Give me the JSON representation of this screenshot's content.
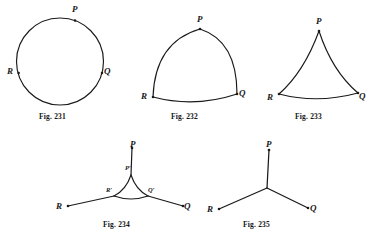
{
  "page": {
    "background_color": "#ffffff",
    "ink_color": "#1a1a1a",
    "width": 375,
    "height": 238
  },
  "figures": [
    {
      "id": "fig-231",
      "caption": "Fig. 231",
      "shape": "circle",
      "description": "A plain circle with three marked points P, R and Q on its circumference.",
      "vertices": [
        {
          "label": "P",
          "position": "top"
        },
        {
          "label": "R",
          "position": "left"
        },
        {
          "label": "Q",
          "position": "right"
        }
      ]
    },
    {
      "id": "fig-232",
      "caption": "Fig. 232",
      "shape": "convex-curved-triangle",
      "description": "A Reuleaux-style triangle whose three sides bulge outward, with vertices P, R and Q.",
      "vertices": [
        {
          "label": "P",
          "position": "top"
        },
        {
          "label": "R",
          "position": "bottom-left"
        },
        {
          "label": "Q",
          "position": "bottom-right"
        }
      ]
    },
    {
      "id": "fig-233",
      "caption": "Fig. 233",
      "shape": "concave-curved-triangle",
      "description": "A curved triangle with cusped vertices; sides PR and PQ curve inward while side RQ bows slightly outward.",
      "vertices": [
        {
          "label": "P",
          "position": "top"
        },
        {
          "label": "R",
          "position": "bottom-left"
        },
        {
          "label": "Q",
          "position": "bottom-right"
        }
      ]
    },
    {
      "id": "fig-234",
      "caption": "Fig. 234",
      "shape": "concave-triangle-with-rays",
      "description": "A small concave curved triangle with cusps at P', R' and Q'; straight rays extend outward from each cusp to the outer points P, R and Q.",
      "vertices": [
        {
          "label": "P",
          "position": "top"
        },
        {
          "label": "R",
          "position": "bottom-left"
        },
        {
          "label": "Q",
          "position": "bottom-right"
        }
      ],
      "inner_vertices": [
        {
          "label": "P′",
          "position": "top"
        },
        {
          "label": "R′",
          "position": "left"
        },
        {
          "label": "Q′",
          "position": "right"
        }
      ]
    },
    {
      "id": "fig-235",
      "caption": "Fig. 235",
      "shape": "three-ray-junction",
      "description": "Three straight segments meeting at a single central junction, ending at the points P, R and Q.",
      "vertices": [
        {
          "label": "P",
          "position": "top"
        },
        {
          "label": "R",
          "position": "bottom-left"
        },
        {
          "label": "Q",
          "position": "bottom-right"
        }
      ]
    }
  ]
}
